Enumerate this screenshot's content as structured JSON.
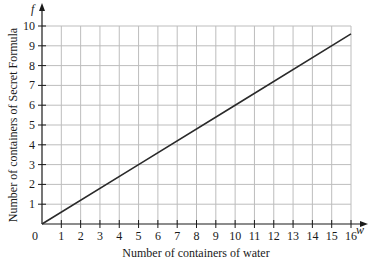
{
  "chart_data": {
    "type": "line",
    "title": "",
    "xlabel": "Number of containers of water",
    "ylabel": "Number of containers of Secret Formula",
    "x_var": "w",
    "y_var": "f",
    "xlim": [
      0,
      16
    ],
    "ylim": [
      0,
      10
    ],
    "x_ticks": [
      "1",
      "2",
      "3",
      "4",
      "5",
      "6",
      "7",
      "8",
      "9",
      "10",
      "11",
      "12",
      "13",
      "14",
      "15",
      "16"
    ],
    "y_ticks": [
      "1",
      "2",
      "3",
      "4",
      "5",
      "6",
      "7",
      "8",
      "9",
      "10"
    ],
    "origin_label": "0",
    "grid": true,
    "series": [
      {
        "name": "f = 0.6w",
        "x": [
          0,
          5,
          10,
          16
        ],
        "y": [
          0,
          3,
          6,
          9.6
        ]
      }
    ],
    "colors": {
      "line": "#2a2a2a",
      "grid": "#bdbdbd",
      "axis": "#1a1a1a"
    }
  }
}
